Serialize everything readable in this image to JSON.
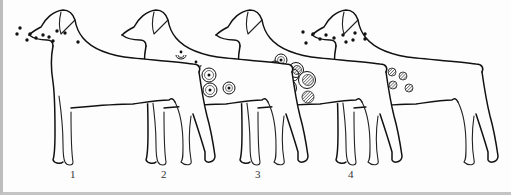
{
  "figure": {
    "colors": {
      "line": "#111111",
      "background": "#fdfdfd",
      "border": "#bdbdbd",
      "hatch": "#333333"
    }
  },
  "stages": [
    {
      "label": "1",
      "label_x": 67,
      "label_y": 172,
      "dx": 0,
      "lesion_type": "airborne-particles"
    },
    {
      "label": "2",
      "label_x": 158,
      "label_y": 172,
      "dx": 93,
      "lesion_type": "ring-lesions-with-center-dot"
    },
    {
      "label": "3",
      "label_x": 252,
      "label_y": 172,
      "dx": 187,
      "lesion_type": "overlapping-rings-hatched"
    },
    {
      "label": "4",
      "label_x": 345,
      "label_y": 172,
      "dx": 283,
      "lesion_type": "hatched-spots-with-particles"
    }
  ],
  "particles_stage1": [
    [
      17,
      28
    ],
    [
      14,
      34
    ],
    [
      27,
      34
    ],
    [
      24,
      40
    ],
    [
      33,
      38
    ],
    [
      40,
      35
    ],
    [
      46,
      37
    ],
    [
      54,
      31
    ],
    [
      62,
      33
    ],
    [
      50,
      41
    ],
    [
      75,
      42
    ]
  ],
  "particles_stage4": [
    [
      300,
      32
    ],
    [
      310,
      34
    ],
    [
      303,
      43
    ],
    [
      317,
      39
    ],
    [
      323,
      35
    ],
    [
      331,
      38
    ],
    [
      340,
      35
    ],
    [
      343,
      42
    ],
    [
      352,
      33
    ],
    [
      350,
      40
    ],
    [
      362,
      34
    ],
    [
      362,
      39
    ]
  ],
  "lesions_stage2": [
    {
      "x": 178,
      "y": 56,
      "r": 5,
      "type": "crescent"
    },
    {
      "x": 193,
      "y": 66,
      "r": 5,
      "type": "crescent"
    },
    {
      "x": 206,
      "y": 75,
      "r": 7,
      "type": "ring-dot"
    },
    {
      "x": 191,
      "y": 82,
      "r": 6,
      "type": "crescent"
    },
    {
      "x": 207,
      "y": 90,
      "r": 7,
      "type": "ring-dot"
    },
    {
      "x": 226,
      "y": 88,
      "r": 6,
      "type": "ring-dot"
    }
  ],
  "lesions_stage3": [
    {
      "x": 278,
      "y": 60,
      "r": 6,
      "type": "ring-dot"
    },
    {
      "x": 272,
      "y": 67,
      "r": 6,
      "type": "ring"
    },
    {
      "x": 293,
      "y": 70,
      "r": 6,
      "type": "ring-hatched"
    },
    {
      "x": 290,
      "y": 75,
      "r": 6,
      "type": "ring"
    },
    {
      "x": 304,
      "y": 80,
      "r": 7,
      "type": "ring-hatched"
    },
    {
      "x": 285,
      "y": 88,
      "r": 7,
      "type": "ring-hatched"
    },
    {
      "x": 305,
      "y": 97,
      "r": 6,
      "type": "hatched"
    }
  ],
  "lesions_stage4": [
    {
      "x": 377,
      "y": 71,
      "r": 4,
      "type": "hatched"
    },
    {
      "x": 389,
      "y": 72,
      "r": 4,
      "type": "hatched"
    },
    {
      "x": 400,
      "y": 76,
      "r": 4,
      "type": "hatched"
    },
    {
      "x": 379,
      "y": 82,
      "r": 4,
      "type": "hatched"
    },
    {
      "x": 390,
      "y": 85,
      "r": 4,
      "type": "hatched"
    },
    {
      "x": 406,
      "y": 88,
      "r": 4,
      "type": "hatched"
    }
  ]
}
